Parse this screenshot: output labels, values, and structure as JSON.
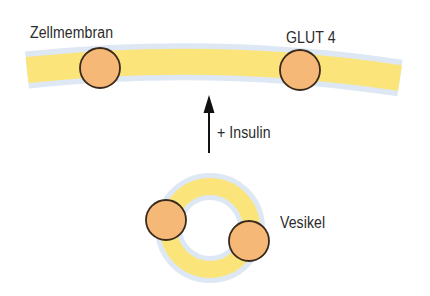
{
  "diagram": {
    "labels": {
      "membrane": "Zellmembran",
      "transporter": "GLUT 4",
      "stimulus": "+ Insulin",
      "vesicle": "Vesikel"
    },
    "colors": {
      "background": "#ffffff",
      "lipid_core": "#fbe57a",
      "lipid_edge": "#dde8f4",
      "transporter_fill": "#f5b877",
      "transporter_stroke": "#3a2a1c",
      "arrow": "#111111",
      "text": "#2b2b2b"
    },
    "elements": {
      "membrane_transporters": 2,
      "vesicle_transporters": 2,
      "arrow_direction": "up"
    }
  }
}
